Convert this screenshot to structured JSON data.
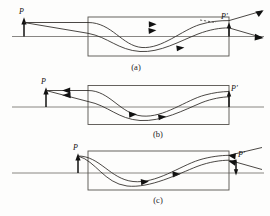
{
  "figure": {
    "title": "",
    "panels": [
      {
        "id": "a",
        "caption": "(a)",
        "object_label": "P",
        "image_label": "P'",
        "object_position": "left-of-rod, upright, outside",
        "image_position": "right-end-of-rod, upright, virtual-diverging",
        "description": "Rays from object P enter the GRIN rod, follow sinusoidal paths and emerge diverging from image point P' at the right face.",
        "ray_count": 2,
        "rays_direction": "left-to-right",
        "has_dashed_construction": true,
        "object_arrow_direction": "up",
        "image_arrow_direction": "up"
      },
      {
        "id": "b",
        "caption": "(b)",
        "object_label": "P",
        "image_label": "P'",
        "object_position": "left-of-rod, upright, outside",
        "image_position": "right-face-of-rod, upright, real",
        "description": "Object P is imaged to a real image P' located exactly on the right end face of the GRIN rod.",
        "ray_count": 2,
        "rays_direction": "left-to-right",
        "has_dashed_construction": false,
        "object_arrow_direction": "up",
        "image_arrow_direction": "up"
      },
      {
        "id": "c",
        "caption": "(c)",
        "object_label": "P",
        "image_label": "P'",
        "object_position": "left-face-of-rod, upright",
        "image_position": "right-of-rod, inverted, diverging",
        "description": "Object P sits on the left end face of the GRIN rod; rays emerge to form an inverted image P' outside the right face.",
        "ray_count": 2,
        "rays_direction": "left-to-right",
        "has_dashed_construction": false,
        "object_arrow_direction": "up",
        "image_arrow_direction": "down"
      }
    ],
    "colors": {
      "rod_outline": "#55524e",
      "axis": "#6a6763",
      "ray": "#2a2724",
      "label": "#111111",
      "background": "#fdfdfc"
    }
  }
}
